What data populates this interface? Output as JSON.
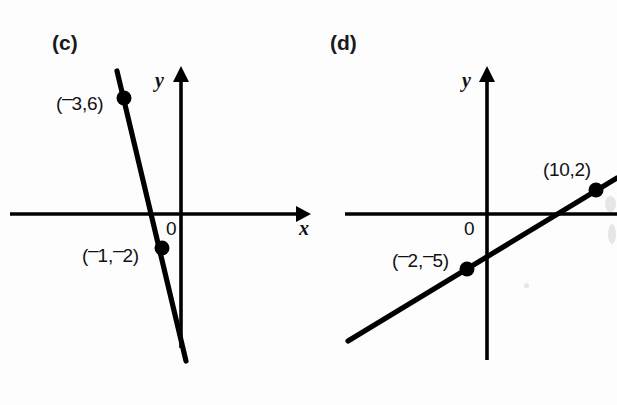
{
  "figure": {
    "width": 617,
    "height": 405,
    "background_color": "#fdfdfd",
    "ink_color": "#000000"
  },
  "panels": [
    {
      "id": "c",
      "label": "(c)",
      "axis_x_name": "x",
      "axis_y_name": "y",
      "origin_label": "0",
      "point_labels": [
        {
          "text": "(⁻3,6)",
          "minus_leading": true,
          "x": 58,
          "y": 88
        },
        {
          "text": "(⁻1,⁻2)",
          "minus_leading": true,
          "x": 84,
          "y": 240
        }
      ]
    },
    {
      "id": "d",
      "label": "(d)",
      "axis_x_name": "x",
      "axis_y_name": "y",
      "origin_label": "0",
      "point_labels": [
        {
          "text": "(10,2)",
          "minus_leading": false,
          "x": 543,
          "y": 160
        },
        {
          "text": "(⁻2,⁻5)",
          "minus_leading": true,
          "x": 392,
          "y": 245
        }
      ]
    }
  ],
  "chart_data": [
    {
      "type": "line",
      "title": "(c)",
      "xlabel": "x",
      "ylabel": "y",
      "grid": false,
      "legend": "none",
      "axes": {
        "x_arrow": "right",
        "y_arrow": "up",
        "origin_label": "0"
      },
      "xlim": [
        -3.4,
        6.5
      ],
      "ylim": [
        -7.6,
        7.6
      ],
      "points": [
        {
          "label": "(⁻3,6)",
          "x": -3,
          "y": 6
        },
        {
          "label": "(⁻1,⁻2)",
          "x": -1,
          "y": -2
        }
      ],
      "line": {
        "slope": -4,
        "intercept": -6,
        "equation": "y = -4x - 6"
      },
      "annotations": [
        "(⁻3,6)",
        "(⁻1,⁻2)",
        "0",
        "x",
        "y"
      ]
    },
    {
      "type": "line",
      "title": "(d)",
      "xlabel": "x",
      "ylabel": "y",
      "grid": false,
      "legend": "none",
      "axes": {
        "x_arrow": "right",
        "y_arrow": "up",
        "origin_label": "0"
      },
      "xlim": [
        -13,
        12
      ],
      "ylim": [
        -13,
        13
      ],
      "points": [
        {
          "label": "(⁻2,⁻5)",
          "x": -2,
          "y": -5
        },
        {
          "label": "(10,2)",
          "x": 10,
          "y": 2
        }
      ],
      "line": {
        "slope": 0.5833,
        "intercept": -3.833,
        "equation": "y = (7/12)x - 23/6"
      },
      "annotations": [
        "(10,2)",
        "(⁻2,⁻5)",
        "0",
        "x",
        "y"
      ]
    }
  ]
}
